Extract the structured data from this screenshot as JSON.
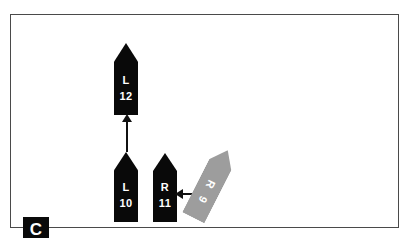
{
  "figure": {
    "panel_label": "C",
    "background_color": "#ffffff",
    "border_color": "#4a4a4a"
  },
  "markers": [
    {
      "id": "l12",
      "letter": "L",
      "number": "12",
      "color": "#090909",
      "fill_name": "black",
      "orientation_deg": 0
    },
    {
      "id": "l10",
      "letter": "L",
      "number": "10",
      "color": "#090909",
      "fill_name": "black",
      "orientation_deg": 0
    },
    {
      "id": "r11",
      "letter": "R",
      "number": "11",
      "color": "#090909",
      "fill_name": "black",
      "orientation_deg": 0
    },
    {
      "id": "r9",
      "letter": "R",
      "number": "9",
      "color": "#9d9d9d",
      "fill_name": "gray",
      "orientation_deg": 27
    }
  ],
  "arrows": [
    {
      "id": "arrow-up",
      "direction": "up",
      "color": "#111111"
    },
    {
      "id": "arrow-left",
      "direction": "left",
      "color": "#111111"
    }
  ]
}
